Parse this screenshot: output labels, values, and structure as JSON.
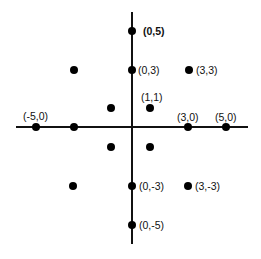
{
  "diagram": {
    "title": "",
    "axes": {
      "x": {
        "from_px": 16,
        "to_px": 248,
        "y_px": 127
      },
      "y": {
        "from_px": 12,
        "to_px": 244,
        "x_px": 132
      },
      "origin_px": [
        132,
        127
      ],
      "unit_px": 19
    },
    "points": [
      {
        "id": "p-0-5",
        "coord": [
          0,
          5
        ],
        "label": "(0,5)",
        "bold": true,
        "px": [
          132,
          31
        ],
        "label_px": [
          143,
          26
        ]
      },
      {
        "id": "p-0-3",
        "coord": [
          0,
          3
        ],
        "label": "(0,3)",
        "bold": false,
        "px": [
          132,
          70
        ],
        "label_px": [
          138,
          65
        ]
      },
      {
        "id": "p-3-3",
        "coord": [
          3,
          3
        ],
        "label": "(3,3)",
        "bold": false,
        "px": [
          189,
          70
        ],
        "label_px": [
          196,
          65
        ]
      },
      {
        "id": "p-m3-3",
        "coord": [
          -3,
          3
        ],
        "label": "",
        "bold": false,
        "px": [
          74,
          70
        ]
      },
      {
        "id": "p-1-1",
        "coord": [
          1,
          1
        ],
        "label": "(1,1)",
        "bold": false,
        "px": [
          150,
          108
        ],
        "label_px": [
          141,
          92
        ]
      },
      {
        "id": "p-m1-1",
        "coord": [
          -1,
          1
        ],
        "label": "",
        "bold": false,
        "px": [
          111,
          108
        ]
      },
      {
        "id": "p-m5-0",
        "coord": [
          -5,
          0
        ],
        "label": "(-5,0)",
        "bold": false,
        "px": [
          36,
          127
        ],
        "label_px": [
          23,
          111
        ]
      },
      {
        "id": "p-m3-0",
        "coord": [
          -3,
          0
        ],
        "label": "",
        "bold": false,
        "px": [
          74,
          127
        ]
      },
      {
        "id": "p-3-0",
        "coord": [
          3,
          0
        ],
        "label": "(3,0)",
        "bold": false,
        "px": [
          188,
          127
        ],
        "label_px": [
          177,
          112
        ]
      },
      {
        "id": "p-5-0",
        "coord": [
          5,
          0
        ],
        "label": "(5,0)",
        "bold": false,
        "px": [
          226,
          127
        ],
        "label_px": [
          215,
          112
        ]
      },
      {
        "id": "p-m1-m1",
        "coord": [
          -1,
          -1
        ],
        "label": "",
        "bold": false,
        "px": [
          111,
          147
        ]
      },
      {
        "id": "p-1-m1",
        "coord": [
          1,
          -1
        ],
        "label": "",
        "bold": false,
        "px": [
          150,
          147
        ]
      },
      {
        "id": "p-m3-m3",
        "coord": [
          -3,
          -3
        ],
        "label": "",
        "bold": false,
        "px": [
          73,
          186
        ]
      },
      {
        "id": "p-0-m3",
        "coord": [
          0,
          -3
        ],
        "label": "(0,-3)",
        "bold": false,
        "px": [
          132,
          186
        ],
        "label_px": [
          139,
          181
        ]
      },
      {
        "id": "p-3-m3",
        "coord": [
          3,
          -3
        ],
        "label": "(3,-3)",
        "bold": false,
        "px": [
          188,
          186
        ],
        "label_px": [
          195,
          181
        ]
      },
      {
        "id": "p-0-m5",
        "coord": [
          0,
          -5
        ],
        "label": "(0,-5)",
        "bold": false,
        "px": [
          132,
          225
        ],
        "label_px": [
          139,
          220
        ]
      }
    ],
    "colors": {
      "axis": "#111111",
      "dot": "#000000",
      "label": "#111111",
      "background": "#ffffff"
    }
  }
}
